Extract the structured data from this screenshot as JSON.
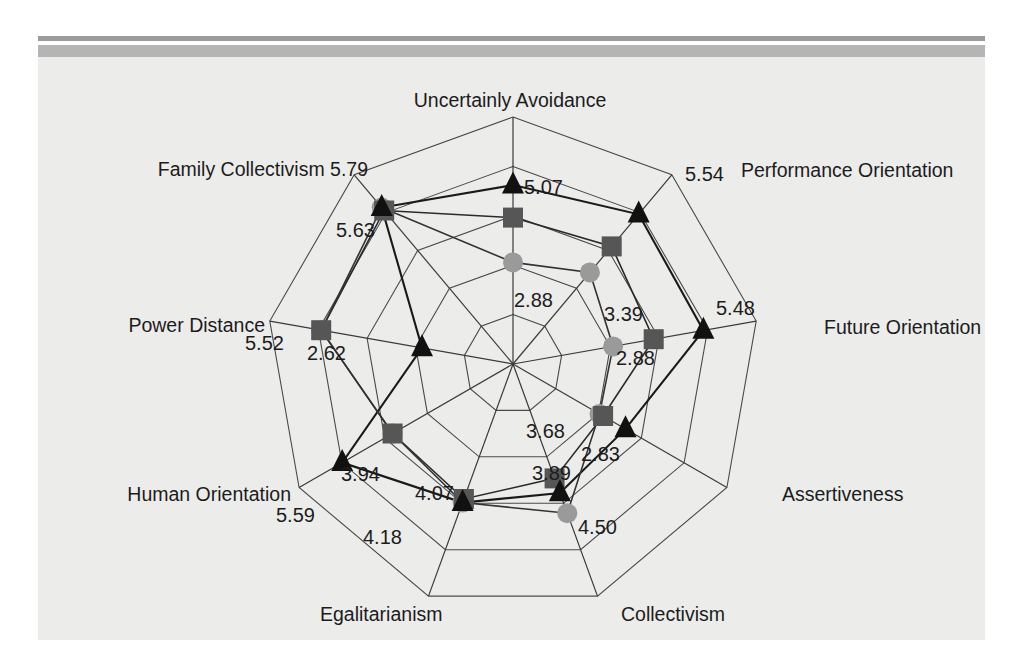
{
  "figure": {
    "background_color": "#ececeb",
    "rule_thin_color": "#9b9b9b",
    "rule_thick_color": "#b5b5b5"
  },
  "chart_data": {
    "type": "radar",
    "title": "",
    "subtitle": "",
    "xlabel": "",
    "ylabel": "",
    "grid": true,
    "legend_position": "none",
    "rings": 5,
    "rlim": [
      0,
      7
    ],
    "categories": [
      "Uncertainly Avoidance",
      "Performance Orientation",
      "Future Orientation",
      "Assertiveness",
      "Collectivism",
      "Egalitarianism",
      "Human Orientation",
      "Power Distance",
      "Family Collectivism"
    ],
    "series": [
      {
        "name": "series-triangle",
        "marker": "triangle",
        "color": "#111111",
        "values": [
          5.07,
          5.54,
          5.48,
          3.68,
          3.89,
          4.18,
          5.59,
          2.62,
          5.79
        ]
      },
      {
        "name": "series-square",
        "marker": "square",
        "color": "#565656",
        "values": [
          4.15,
          4.35,
          4.05,
          2.95,
          3.45,
          4.07,
          3.94,
          5.52,
          5.68
        ]
      },
      {
        "name": "series-circle",
        "marker": "circle",
        "color": "#9a9a9a",
        "values": [
          2.88,
          3.39,
          2.88,
          2.83,
          4.5,
          4.18,
          3.94,
          5.52,
          5.79
        ]
      }
    ],
    "point_labels": [
      {
        "text": "5.07",
        "axis": "Uncertainly Avoidance",
        "series": "series-triangle"
      },
      {
        "text": "2.88",
        "axis": "Uncertainly Avoidance",
        "series": "series-circle"
      },
      {
        "text": "5.54",
        "axis": "Performance Orientation",
        "series": "series-triangle"
      },
      {
        "text": "3.39",
        "axis": "Performance Orientation",
        "series": "series-circle"
      },
      {
        "text": "5.48",
        "axis": "Future Orientation",
        "series": "series-triangle"
      },
      {
        "text": "2.88",
        "axis": "Future Orientation",
        "series": "series-circle"
      },
      {
        "text": "3.68",
        "axis": "Assertiveness",
        "series": "series-triangle"
      },
      {
        "text": "2.83",
        "axis": "Assertiveness",
        "series": "series-circle"
      },
      {
        "text": "3.89",
        "axis": "Collectivism",
        "series": "series-triangle"
      },
      {
        "text": "4.50",
        "axis": "Collectivism",
        "series": "series-circle"
      },
      {
        "text": "4.18",
        "axis": "Egalitarianism",
        "series": "series-triangle"
      },
      {
        "text": "4.07",
        "axis": "Egalitarianism",
        "series": "series-square"
      },
      {
        "text": "5.59",
        "axis": "Human Orientation",
        "series": "series-triangle"
      },
      {
        "text": "3.94",
        "axis": "Human Orientation",
        "series": "series-square"
      },
      {
        "text": "2.62",
        "axis": "Power Distance",
        "series": "series-triangle"
      },
      {
        "text": "5.52",
        "axis": "Power Distance",
        "series": "series-circle"
      },
      {
        "text": "5.79",
        "axis": "Family Collectivism",
        "series": "series-triangle"
      },
      {
        "text": "5.63",
        "axis": "Family Collectivism",
        "series": "series-square"
      }
    ]
  },
  "labels": {
    "uncertainty_avoidance": "Uncertainly Avoidance",
    "performance_orientation": "Performance Orientation",
    "future_orientation": "Future Orientation",
    "assertiveness": "Assertiveness",
    "collectivism": "Collectivism",
    "egalitarianism": "Egalitarianism",
    "human_orientation": "Human Orientation",
    "power_distance": "Power Distance",
    "family_collectivism": "Family Collectivism 5.79"
  },
  "values": {
    "ua_tri": "5.07",
    "ua_ci": "2.88",
    "po_tri": "5.54",
    "po_ci": "3.39",
    "fo_tri": "5.48",
    "fo_ci": "2.88",
    "as_tri": "3.68",
    "as_ci": "2.83",
    "co_tri": "3.89",
    "co_ci": "4.50",
    "eg_tri": "4.18",
    "eg_sq": "4.07",
    "ho_tri": "5.59",
    "ho_sq": "3.94",
    "pd_tri": "2.62",
    "pd_ci": "5.52",
    "fc_sq": "5.63"
  }
}
